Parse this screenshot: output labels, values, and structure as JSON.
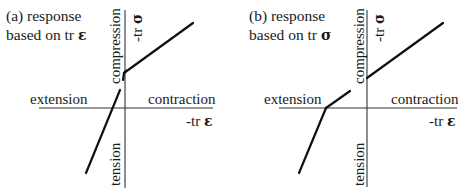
{
  "figure": {
    "panels": [
      {
        "id": "a",
        "title_line1": "(a) response",
        "title_line2_prefix": "based on tr ",
        "title_line2_symbol": "ε",
        "x_positive_label": "contraction",
        "x_negative_label": "extension",
        "x_axis_label_prefix": "-tr ",
        "x_axis_label_symbol": "ε",
        "y_positive_label": "compression",
        "y_negative_label": "tension",
        "y_axis_label_prefix": "-tr ",
        "y_axis_label_symbol": "σ"
      },
      {
        "id": "b",
        "title_line1": "(b) response",
        "title_line2_prefix": "based on tr ",
        "title_line2_symbol": "σ",
        "x_positive_label": "contraction",
        "x_negative_label": "extension",
        "x_axis_label_prefix": "-tr ",
        "x_axis_label_symbol": "ε",
        "y_positive_label": "compression",
        "y_negative_label": "tension",
        "y_axis_label_prefix": "-tr ",
        "y_axis_label_symbol": "σ"
      }
    ],
    "line_color": "#111111",
    "axis_color": "#333333"
  }
}
